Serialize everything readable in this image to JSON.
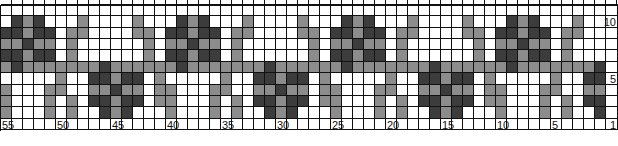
{
  "chart_data": {
    "type": "heatmap",
    "title": "",
    "columns_count": 55,
    "column_numbering": "right-to-left, 55 at left to 1 at right",
    "column_labels": [
      {
        "col": 55,
        "text": "55"
      },
      {
        "col": 50,
        "text": "50"
      },
      {
        "col": 45,
        "text": "45"
      },
      {
        "col": 40,
        "text": "40"
      },
      {
        "col": 35,
        "text": "35"
      },
      {
        "col": 30,
        "text": "30"
      },
      {
        "col": 25,
        "text": "25"
      },
      {
        "col": 20,
        "text": "20"
      },
      {
        "col": 15,
        "text": "15"
      },
      {
        "col": 10,
        "text": "10"
      },
      {
        "col": 5,
        "text": "5"
      }
    ],
    "row_labels": [
      {
        "row": 10,
        "text": "10"
      },
      {
        "row": 5,
        "text": "5"
      },
      {
        "row": 1,
        "text": "1"
      }
    ],
    "legend": {
      "W": {
        "name": "background",
        "color": "#ffffff"
      },
      "M": {
        "name": "medium gray",
        "color": "#8c8c8c"
      },
      "L": {
        "name": "light gray",
        "color": "#a8a8a8"
      },
      "D": {
        "name": "dark gray",
        "color": "#3c3c3c"
      }
    },
    "rows_top_to_bottom": [
      {
        "row": 11,
        "cells": "WWWWWWWWWWWWWWWWWWWWWWWWWWWWWWWWWWWWWWWWWWWWWWWWWWWWWWW"
      },
      {
        "row": 10,
        "cells": "WDMDWWWMWWWWMWWWDMDWWWMWWWWMWWWDMDWWWMWWWWMWWWDMDWWWMWW"
      },
      {
        "row": 9,
        "cells": "DDMDDWMMWWWWMMWDDMDDWMMWWWWMMWDDMDDWMMWWWWMMWDDMDDWMMWW"
      },
      {
        "row": 8,
        "cells": "MMDMMWMWWWWWWMWMMDMMWMWWWWWWMWMMDMMWMWWWWWWMWMMDMMWMWWW"
      },
      {
        "row": 7,
        "cells": "DDMDDWMWWWWWWMWDDMDDWMWWWWWWMWDDMDDWMWWWWWWMWDDMDDWMWWW"
      },
      {
        "row": 6,
        "cells": "MDMMMMMMMDMMMMMMDMMMMMMMDMMMMMMDMMMMMMMDMMMMMMDMMMMMMMD"
      },
      {
        "row": 5,
        "cells": "WWWWWMWWDDMDDWMWWWWWMWWDDMDDWMWWWWWMWWDDMDDWMWWWWWMWWDD"
      },
      {
        "row": 4,
        "cells": "MWWWMMWWMMDMMWMMWWWMMWWMMDMMWMMWWWMMWWMMDMMWMMWWWMMWWMM"
      },
      {
        "row": 3,
        "cells": "MWWWMWMWDDMDDWMMWWWMWMWDDMDDWMMWWWMWMWDDMDDWMMWWWMWMWDD"
      },
      {
        "row": 2,
        "cells": "MWWWMWMWWDMDWWWMWWWMWMWWDMDWWWMWWWMWMWWDMDWWWMWWWMWMWWD"
      },
      {
        "row": 1,
        "cells": "WWWWWWWWWWWWWWWWWWWWWWWWWWWWWWWWWWWWWWWWWWWWWWWWWWWWWWW"
      }
    ]
  }
}
